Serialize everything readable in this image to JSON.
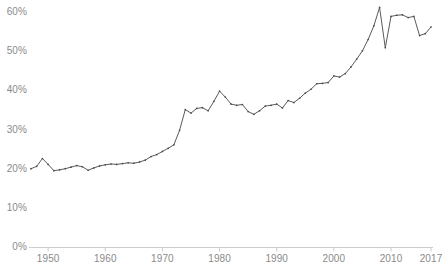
{
  "chart_data": {
    "type": "line",
    "title": "",
    "subtitle": "",
    "xlabel": "",
    "ylabel": "",
    "xlim": [
      1947,
      2017
    ],
    "ylim": [
      0,
      65
    ],
    "grid": false,
    "legend_position": "none",
    "line_color": "#5a5a5a",
    "marker_color": "#4a4a4a",
    "axis_color": "#cccccc",
    "tick_label_color": "#8a8a8a",
    "y_ticks": [
      0,
      10,
      20,
      30,
      40,
      50,
      60
    ],
    "y_tick_labels": [
      "0%",
      "10%",
      "20%",
      "30%",
      "40%",
      "50%",
      "60%"
    ],
    "x_ticks": [
      1950,
      1960,
      1970,
      1980,
      1990,
      2000,
      2010,
      2017
    ],
    "x_tick_labels": [
      "1950",
      "1960",
      "1970",
      "1980",
      "1990",
      "2000",
      "2010",
      "2017"
    ],
    "x": [
      1947,
      1948,
      1949,
      1950,
      1951,
      1952,
      1953,
      1954,
      1955,
      1956,
      1957,
      1958,
      1959,
      1960,
      1961,
      1962,
      1963,
      1964,
      1965,
      1966,
      1967,
      1968,
      1969,
      1970,
      1971,
      1972,
      1973,
      1974,
      1975,
      1976,
      1977,
      1978,
      1979,
      1980,
      1981,
      1982,
      1983,
      1984,
      1985,
      1986,
      1987,
      1988,
      1989,
      1990,
      1991,
      1992,
      1993,
      1994,
      1995,
      1996,
      1997,
      1998,
      1999,
      2000,
      2001,
      2002,
      2003,
      2004,
      2005,
      2006,
      2007,
      2008,
      2009,
      2010,
      2011,
      2012,
      2013,
      2014,
      2015,
      2016,
      2017
    ],
    "y": [
      20.0,
      20.6,
      22.6,
      21.1,
      19.5,
      19.7,
      20.0,
      20.4,
      20.8,
      20.5,
      19.6,
      20.2,
      20.7,
      21.0,
      21.2,
      21.1,
      21.3,
      21.5,
      21.4,
      21.7,
      22.2,
      23.1,
      23.6,
      24.4,
      25.2,
      26.1,
      29.8,
      35.1,
      34.2,
      35.4,
      35.6,
      34.8,
      37.2,
      39.8,
      38.3,
      36.5,
      36.2,
      36.4,
      34.6,
      33.9,
      34.8,
      36.0,
      36.2,
      36.5,
      35.5,
      37.4,
      36.9,
      38.0,
      39.3,
      40.3,
      41.7,
      41.8,
      42.0,
      43.7,
      43.4,
      44.3,
      46.0,
      48.0,
      50.1,
      53.0,
      56.5,
      61.2,
      50.9,
      58.9,
      59.2,
      59.3,
      58.6,
      58.9,
      54.0,
      54.5,
      56.2
    ]
  }
}
